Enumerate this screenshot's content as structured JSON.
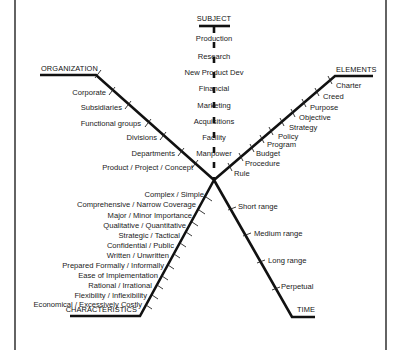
{
  "diagram": {
    "type": "fishbone-like cross diagram",
    "branches": {
      "subject": {
        "title": "SUBJECT",
        "items": [
          "Production",
          "Research",
          "New Product Dev",
          "Financial",
          "Marketing",
          "Acquisitions",
          "Facility",
          "Manpower"
        ]
      },
      "organization": {
        "title": "ORGANIZATION",
        "items": [
          "Corporate",
          "Subsidiaries",
          "Functional groups",
          "Divisions",
          "Departments",
          "Product / Project / Concept"
        ]
      },
      "elements": {
        "title": "ELEMENTS",
        "items": [
          "Charter",
          "Creed",
          "Purpose",
          "Objective",
          "Strategy",
          "Policy",
          "Program",
          "Budget",
          "Procedure",
          "Rule"
        ]
      },
      "characteristics": {
        "title": "CHARACTERISTICS",
        "items": [
          "Complex / Simple",
          "Comprehensive / Narrow Coverage",
          "Major / Minor Importance",
          "Qualitative / Quantitative",
          "Strategic / Tactical",
          "Confidential / Public",
          "Written / Unwritten",
          "Prepared Formally / Informally",
          "Ease of Implementation",
          "Rational / Irrational",
          "Flexibility / Inflexibility",
          "Economical / Excessively Costly"
        ]
      },
      "time": {
        "title": "TIME",
        "items": [
          "Short range",
          "Medium range",
          "Long range",
          "Perpetual"
        ]
      }
    },
    "colors": {
      "line": "#111111",
      "text": "#1a1a1a",
      "background": "#ffffff"
    }
  }
}
